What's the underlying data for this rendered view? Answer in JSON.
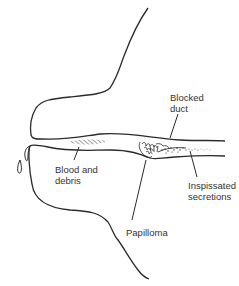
{
  "diagram": {
    "colors": {
      "line": "#2a2a2a",
      "text": "#333333",
      "background": "#ffffff"
    },
    "labels": [
      {
        "id": "blocked-duct",
        "text": "Blocked\nduct"
      },
      {
        "id": "blood-and-debris",
        "text": "Blood and\ndebris"
      },
      {
        "id": "inspissated-secretions",
        "text": "Inspissated\nsecretions"
      },
      {
        "id": "papilloma",
        "text": "Papilloma"
      }
    ]
  }
}
